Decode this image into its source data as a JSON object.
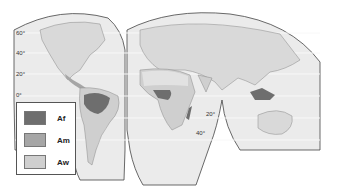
{
  "map": {
    "title": "",
    "projection": "interrupted (Goode homolosine-style)",
    "latitude_labels_left": [
      "60°",
      "40°",
      "20°",
      "0°"
    ],
    "latitude_labels_middle": [
      "20°",
      "40°"
    ],
    "colors": {
      "land": "#d9d9d9",
      "ocean": "#ebebeb",
      "outline": "#444444",
      "Af": "#6e6e6e",
      "Am": "#a6a6a6",
      "Aw": "#cfcfcf"
    }
  },
  "legend": {
    "items": [
      {
        "label": "Af",
        "color": "#6e6e6e"
      },
      {
        "label": "Am",
        "color": "#a6a6a6"
      },
      {
        "label": "Aw",
        "color": "#cfcfcf"
      }
    ]
  }
}
